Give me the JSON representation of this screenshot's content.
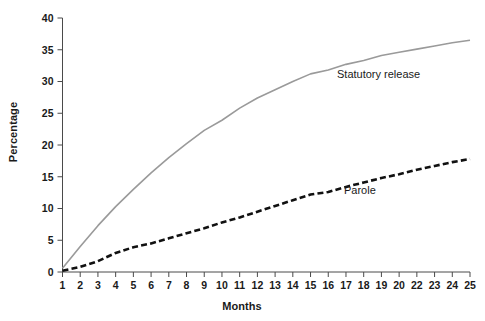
{
  "chart_data": {
    "type": "line",
    "title": "",
    "xlabel": "Months",
    "ylabel": "Percentage",
    "xlim": [
      1,
      25
    ],
    "ylim": [
      0,
      40
    ],
    "grid": false,
    "legend_position": "inline-annotations",
    "x": [
      1,
      2,
      3,
      4,
      5,
      6,
      7,
      8,
      9,
      10,
      11,
      12,
      13,
      14,
      15,
      16,
      17,
      18,
      19,
      20,
      22,
      23,
      24,
      25
    ],
    "xtick_labels": [
      "1",
      "2",
      "3",
      "4",
      "5",
      "6",
      "7",
      "8",
      "9",
      "10",
      "11",
      "12",
      "13",
      "14",
      "15",
      "16",
      "17",
      "18",
      "19",
      "20",
      "22",
      "23",
      "24",
      "25"
    ],
    "ytick_labels": [
      "0",
      "5",
      "10",
      "15",
      "20",
      "25",
      "30",
      "35",
      "40"
    ],
    "ytick_values": [
      0,
      5,
      10,
      15,
      20,
      25,
      30,
      35,
      40
    ],
    "series": [
      {
        "name": "Statutory release",
        "color": "#9a9a9a",
        "style": "solid",
        "width": 1.6,
        "values": [
          0.6,
          4.0,
          7.3,
          10.3,
          13.0,
          15.6,
          18.0,
          20.2,
          22.3,
          23.9,
          25.8,
          27.4,
          28.7,
          30.0,
          31.2,
          31.8,
          32.7,
          33.3,
          34.1,
          34.6,
          35.1,
          35.6,
          36.1,
          36.5
        ]
      },
      {
        "name": "Parole",
        "color": "#111111",
        "style": "dashed",
        "width": 2.6,
        "values": [
          0.2,
          0.8,
          1.7,
          3.0,
          3.9,
          4.5,
          5.3,
          6.1,
          6.9,
          7.8,
          8.6,
          9.5,
          10.4,
          11.3,
          12.2,
          12.6,
          13.4,
          14.1,
          14.8,
          15.4,
          16.1,
          16.7,
          17.3,
          17.8
        ]
      }
    ],
    "annotations": [
      {
        "text": "Statutory release",
        "series": "Statutory release"
      },
      {
        "text": "Parole",
        "series": "Parole"
      }
    ]
  },
  "axes": {
    "x_title": "Months",
    "y_title": "Percentage"
  }
}
